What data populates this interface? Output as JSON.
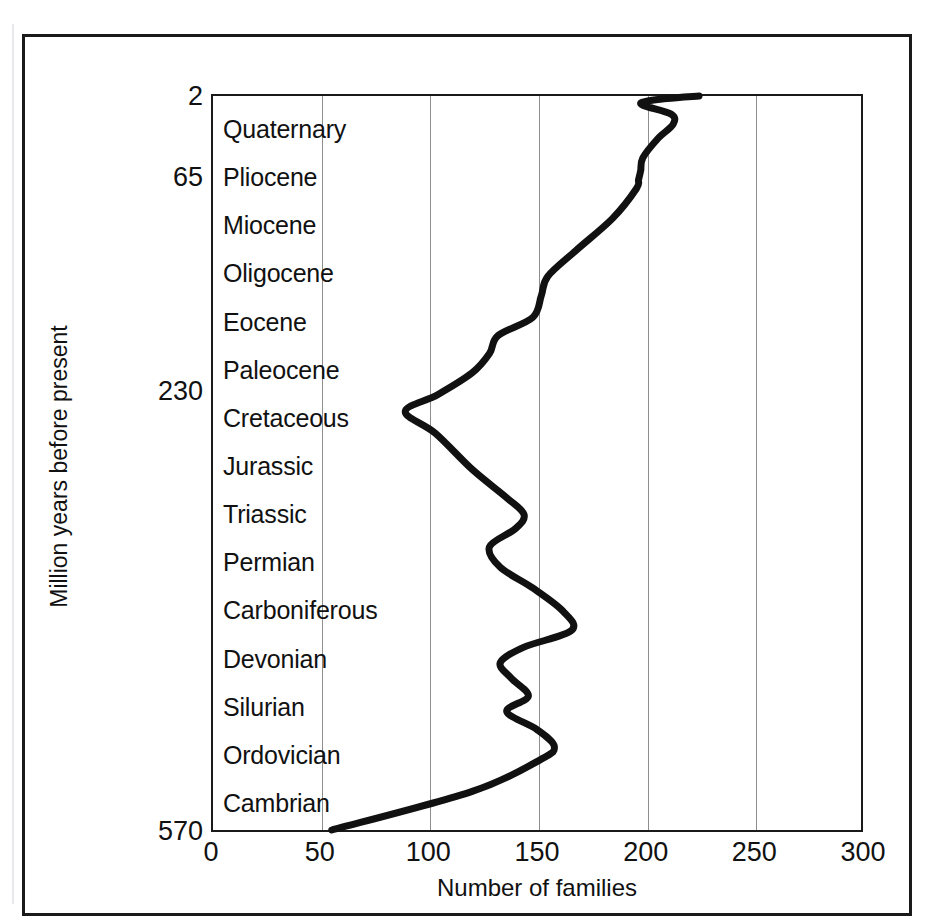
{
  "figure": {
    "y_axis_title": "Million years before present",
    "x_axis_title": "Number of families"
  },
  "chart_data": {
    "type": "line",
    "title": "",
    "subtitle": "",
    "xlabel": "Number of families",
    "ylabel": "Million years before present",
    "orientation": "horizontal-time-axis",
    "xlim": [
      0,
      300
    ],
    "ylim_mya": [
      570,
      0
    ],
    "grid": true,
    "grid_axis": "x",
    "legend": null,
    "xticks": [
      "0",
      "50",
      "100",
      "150",
      "200",
      "250",
      "300"
    ],
    "xtick_values": [
      0,
      50,
      100,
      150,
      200,
      250,
      300
    ],
    "yticks": [
      "2",
      "65",
      "230",
      "570"
    ],
    "ytick_values": [
      2,
      65,
      230,
      570
    ],
    "period_bands": [
      "Quaternary",
      "Pliocene",
      "Miocene",
      "Oligocene",
      "Eocene",
      "Paleocene",
      "Cretaceous",
      "Jurassic",
      "Triassic",
      "Permian",
      "Carboniferous",
      "Devonian",
      "Silurian",
      "Ordovician",
      "Cambrian"
    ],
    "series": [
      {
        "name": "Number of families",
        "color": "#111111",
        "points": [
          {
            "period": "Cambrian",
            "mya": 570,
            "families": 55
          },
          {
            "period": "Cambrian",
            "mya": 540,
            "families": 120
          },
          {
            "period": "Cambrian",
            "mya": 515,
            "families": 152
          },
          {
            "period": "Ordovician",
            "mya": 505,
            "families": 158
          },
          {
            "period": "Ordovician",
            "mya": 492,
            "families": 150
          },
          {
            "period": "Ordovician",
            "mya": 478,
            "families": 136
          },
          {
            "period": "Ordovician",
            "mya": 466,
            "families": 146
          },
          {
            "period": "Silurian",
            "mya": 452,
            "families": 138
          },
          {
            "period": "Silurian",
            "mya": 440,
            "families": 133
          },
          {
            "period": "Silurian",
            "mya": 428,
            "families": 144
          },
          {
            "period": "Silurian",
            "mya": 415,
            "families": 166
          },
          {
            "period": "Devonian",
            "mya": 400,
            "families": 162
          },
          {
            "period": "Devonian",
            "mya": 382,
            "families": 148
          },
          {
            "period": "Devonian",
            "mya": 366,
            "families": 133
          },
          {
            "period": "Carboniferous",
            "mya": 350,
            "families": 128
          },
          {
            "period": "Carboniferous",
            "mya": 336,
            "families": 140
          },
          {
            "period": "Carboniferous",
            "mya": 325,
            "families": 144
          },
          {
            "period": "Carboniferous",
            "mya": 312,
            "families": 136
          },
          {
            "period": "Permian",
            "mya": 290,
            "families": 120
          },
          {
            "period": "Permian",
            "mya": 262,
            "families": 103
          },
          {
            "period": "Permian",
            "mya": 245,
            "families": 89
          },
          {
            "period": "Triassic",
            "mya": 232,
            "families": 104
          },
          {
            "period": "Triassic",
            "mya": 215,
            "families": 120
          },
          {
            "period": "Triassic",
            "mya": 200,
            "families": 128
          },
          {
            "period": "Jurassic",
            "mya": 186,
            "families": 132
          },
          {
            "period": "Jurassic",
            "mya": 172,
            "families": 148
          },
          {
            "period": "Jurassic",
            "mya": 155,
            "families": 152
          },
          {
            "period": "Cretaceous",
            "mya": 140,
            "families": 155
          },
          {
            "period": "Cretaceous",
            "mya": 120,
            "families": 168
          },
          {
            "period": "Cretaceous",
            "mya": 95,
            "families": 185
          },
          {
            "period": "Cretaceous",
            "mya": 72,
            "families": 196
          },
          {
            "period": "Paleocene",
            "mya": 65,
            "families": 197
          },
          {
            "period": "Paleocene",
            "mya": 58,
            "families": 198
          },
          {
            "period": "Eocene",
            "mya": 48,
            "families": 199
          },
          {
            "period": "Oligocene",
            "mya": 33,
            "families": 206
          },
          {
            "period": "Miocene",
            "mya": 22,
            "families": 213
          },
          {
            "period": "Miocene",
            "mya": 14,
            "families": 212
          },
          {
            "period": "Pliocene",
            "mya": 6,
            "families": 198
          },
          {
            "period": "Quaternary",
            "mya": 2,
            "families": 210
          },
          {
            "period": "Quaternary",
            "mya": 0,
            "families": 225
          }
        ]
      }
    ]
  }
}
